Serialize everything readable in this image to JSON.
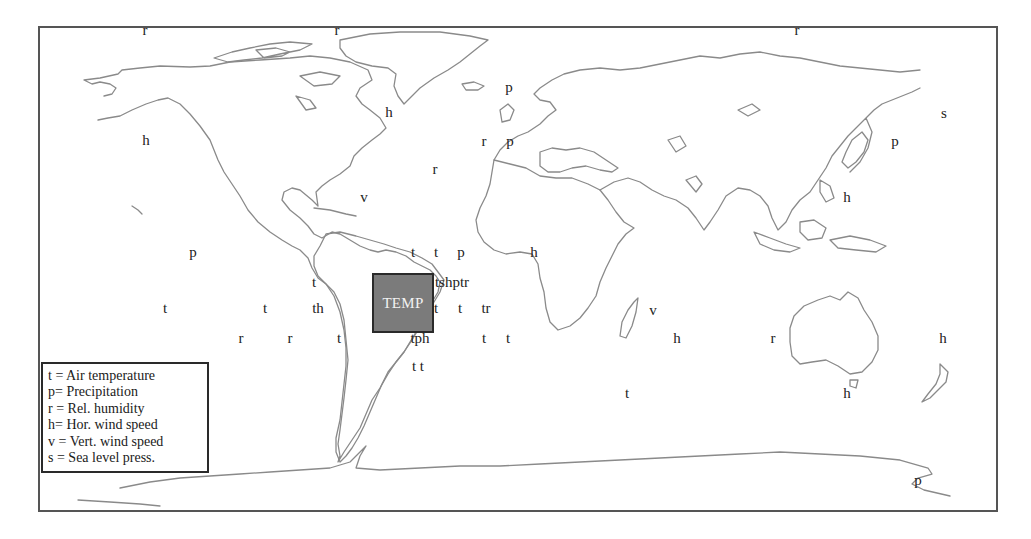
{
  "map": {
    "box_label": "TEMP",
    "colors": {
      "frame": "#555555",
      "coastline": "#8a8a8a",
      "temp_box_fill": "#7b7b7b",
      "temp_box_text": "#f2f2f2",
      "label_text": "#222222"
    },
    "labels": [
      {
        "text": "r",
        "x": 145,
        "y": 30
      },
      {
        "text": "r",
        "x": 337,
        "y": 30
      },
      {
        "text": "r",
        "x": 797,
        "y": 30
      },
      {
        "text": "h",
        "x": 389,
        "y": 112
      },
      {
        "text": "s",
        "x": 944,
        "y": 113
      },
      {
        "text": "p",
        "x": 509,
        "y": 87
      },
      {
        "text": "h",
        "x": 146,
        "y": 140
      },
      {
        "text": "r",
        "x": 484,
        "y": 141
      },
      {
        "text": "p",
        "x": 510,
        "y": 141
      },
      {
        "text": "p",
        "x": 895,
        "y": 141
      },
      {
        "text": "r",
        "x": 435,
        "y": 169
      },
      {
        "text": "v",
        "x": 364,
        "y": 197
      },
      {
        "text": "h",
        "x": 847,
        "y": 197
      },
      {
        "text": "p",
        "x": 193,
        "y": 252
      },
      {
        "text": "t",
        "x": 413,
        "y": 252
      },
      {
        "text": "t",
        "x": 436,
        "y": 252
      },
      {
        "text": "p",
        "x": 461,
        "y": 252
      },
      {
        "text": "h",
        "x": 534,
        "y": 252
      },
      {
        "text": "t",
        "x": 314,
        "y": 282
      },
      {
        "text": "tshptr",
        "x": 452,
        "y": 282
      },
      {
        "text": "t",
        "x": 165,
        "y": 308
      },
      {
        "text": "t",
        "x": 265,
        "y": 308
      },
      {
        "text": "th",
        "x": 318,
        "y": 308
      },
      {
        "text": "t",
        "x": 436,
        "y": 308
      },
      {
        "text": "t",
        "x": 460,
        "y": 308
      },
      {
        "text": "tr",
        "x": 486,
        "y": 308
      },
      {
        "text": "v",
        "x": 653,
        "y": 310
      },
      {
        "text": "r",
        "x": 241,
        "y": 338
      },
      {
        "text": "r",
        "x": 290,
        "y": 338
      },
      {
        "text": "t",
        "x": 339,
        "y": 338
      },
      {
        "text": "tph",
        "x": 420,
        "y": 338
      },
      {
        "text": "t",
        "x": 484,
        "y": 338
      },
      {
        "text": "t",
        "x": 508,
        "y": 338
      },
      {
        "text": "h",
        "x": 677,
        "y": 338
      },
      {
        "text": "r",
        "x": 773,
        "y": 338
      },
      {
        "text": "h",
        "x": 943,
        "y": 338
      },
      {
        "text": "t t",
        "x": 418,
        "y": 366
      },
      {
        "text": "t",
        "x": 627,
        "y": 393
      },
      {
        "text": "h",
        "x": 847,
        "y": 393
      },
      {
        "text": "p",
        "x": 918,
        "y": 480
      }
    ]
  },
  "legend": {
    "items": [
      {
        "symbol": "t",
        "text": "t = Air temperature"
      },
      {
        "symbol": "p",
        "text": "p= Precipitation"
      },
      {
        "symbol": "r",
        "text": "r = Rel. humidity"
      },
      {
        "symbol": "h",
        "text": "h= Hor. wind speed"
      },
      {
        "symbol": "v",
        "text": "v = Vert. wind speed"
      },
      {
        "symbol": "s",
        "text": "s = Sea level press."
      }
    ]
  }
}
